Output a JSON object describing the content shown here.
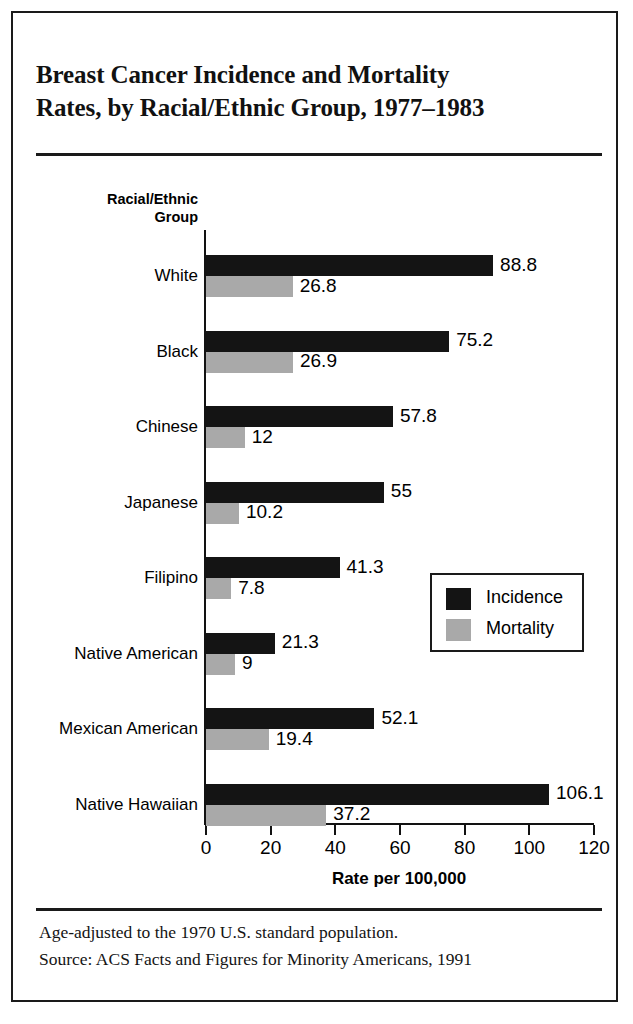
{
  "figure": {
    "title_lines": [
      "Breast Cancer Incidence and Mortality",
      "Rates, by Racial/Ethnic Group, 1977–1983"
    ],
    "footnotes": [
      "Age-adjusted to the 1970 U.S. standard population.",
      "Source: ACS Facts and Figures for Minority Americans, 1991"
    ],
    "colors": {
      "incidence": "#141414",
      "mortality": "#a9a9a9",
      "border": "#1a1a1a",
      "background": "#ffffff"
    }
  },
  "chart_data": {
    "type": "bar",
    "orientation": "horizontal",
    "title": "Breast Cancer Incidence and Mortality Rates, by Racial/Ethnic Group, 1977–1983",
    "xlabel": "Rate per 100,000",
    "ylabel": "Racial/Ethnic Group",
    "ylabel_lines": [
      "Racial/Ethnic",
      "Group"
    ],
    "xlim": [
      0,
      120
    ],
    "xticks": [
      0,
      20,
      40,
      60,
      80,
      100,
      120
    ],
    "xtick_labels": [
      "0",
      "20",
      "40",
      "60",
      "80",
      "100",
      "120"
    ],
    "grid": false,
    "legend_position": "center-right",
    "categories": [
      "White",
      "Black",
      "Chinese",
      "Japanese",
      "Filipino",
      "Native American",
      "Mexican American",
      "Native Hawaiian"
    ],
    "series": [
      {
        "name": "Incidence",
        "color": "#141414",
        "values": [
          88.8,
          75.2,
          57.8,
          55,
          41.3,
          21.3,
          52.1,
          106.1
        ],
        "labels": [
          "88.8",
          "75.2",
          "57.8",
          "55",
          "41.3",
          "21.3",
          "52.1",
          "106.1"
        ]
      },
      {
        "name": "Mortality",
        "color": "#a9a9a9",
        "values": [
          26.8,
          26.9,
          12,
          10.2,
          7.8,
          9,
          19.4,
          37.2
        ],
        "labels": [
          "26.8",
          "26.9",
          "12",
          "10.2",
          "7.8",
          "9",
          "19.4",
          "37.2"
        ]
      }
    ],
    "notes": [
      "Age-adjusted to the 1970 U.S. standard population.",
      "Source: ACS Facts and Figures for Minority Americans, 1991"
    ]
  }
}
